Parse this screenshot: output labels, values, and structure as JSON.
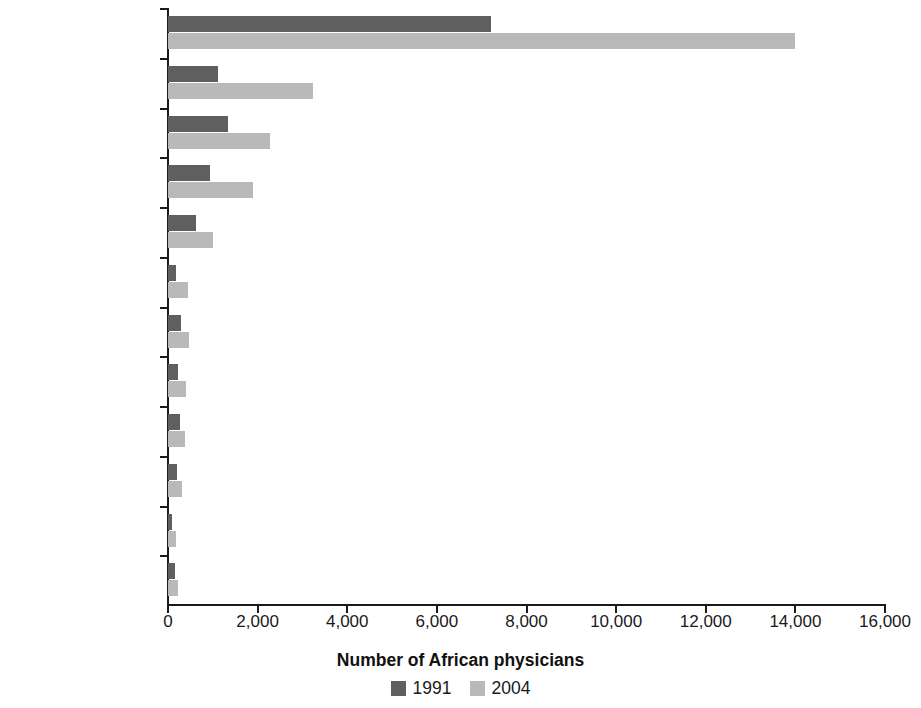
{
  "chart_data": {
    "type": "bar",
    "orientation": "horizontal",
    "title": "",
    "xlabel": "Number of African physicians",
    "ylabel": "",
    "xlim": [
      0,
      16000
    ],
    "xticks": [
      0,
      2000,
      4000,
      6000,
      8000,
      10000,
      12000,
      14000,
      16000
    ],
    "xtick_labels": [
      "0",
      "2,000",
      "4,000",
      "6,000",
      "8,000",
      "10,000",
      "12,000",
      "14,000",
      "16,000"
    ],
    "grid": false,
    "legend_position": "bottom",
    "categories": [
      "United Kingdom",
      "United States",
      "Canada",
      "Australia",
      "New Zealand",
      "Ireland",
      "Italy",
      "Portugal",
      "Germany",
      "Belgium",
      "France",
      "Sweden"
    ],
    "series": [
      {
        "name": "1991",
        "color": "#5f5f5f",
        "values": [
          7200,
          1120,
          1340,
          940,
          620,
          180,
          290,
          220,
          270,
          200,
          80,
          150
        ]
      },
      {
        "name": "2004",
        "color": "#b9b9b9",
        "values": [
          14000,
          3240,
          2280,
          1900,
          1000,
          440,
          470,
          400,
          380,
          310,
          180,
          220
        ]
      }
    ]
  },
  "legend": {
    "items": [
      {
        "label": "1991",
        "color": "#5f5f5f"
      },
      {
        "label": "2004",
        "color": "#b9b9b9"
      }
    ]
  },
  "axis": {
    "x_title": "Number of African physicians"
  },
  "colors": {
    "series_1991": "#5f5f5f",
    "series_2004": "#b9b9b9",
    "axis": "#1a1a1a",
    "background": "#ffffff"
  }
}
